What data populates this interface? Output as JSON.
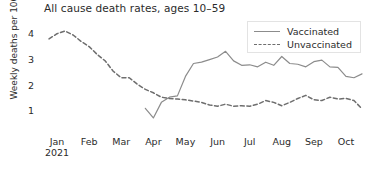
{
  "chart_data": {
    "type": "line",
    "title": "All cause death rates, ages 10–59",
    "xlabel": "",
    "ylabel": "Weekly deaths per 100k",
    "xlim": [
      0,
      40
    ],
    "ylim": [
      0.4,
      4.45
    ],
    "grid": false,
    "legend_position": "top-right",
    "y_ticks": [
      1,
      2,
      3,
      4
    ],
    "x_tick_labels": [
      "Jan",
      "Feb",
      "Mar",
      "Apr",
      "May",
      "Jun",
      "Jul",
      "Aug",
      "Sep",
      "Oct"
    ],
    "x_tick_sublabel": "2021",
    "x_tick_sublabel_index": 0,
    "series": [
      {
        "name": "Vaccinated",
        "style": "solid",
        "color": "#8c8c8c",
        "x": [
          13,
          14,
          15,
          16,
          17,
          18,
          19,
          20,
          21,
          22,
          23,
          24,
          25,
          26,
          27,
          28,
          29,
          30,
          31,
          32,
          33,
          34,
          35,
          36,
          37,
          38,
          39,
          40
        ],
        "values": [
          1.12,
          0.75,
          1.35,
          1.55,
          1.6,
          2.35,
          2.85,
          2.9,
          3.0,
          3.1,
          3.32,
          2.95,
          2.78,
          2.8,
          2.72,
          2.9,
          2.78,
          3.12,
          2.85,
          2.82,
          2.72,
          2.92,
          2.98,
          2.72,
          2.7,
          2.35,
          2.3,
          2.45
        ],
        "annotations": [
          {
            "label": "peak",
            "x": 23,
            "y": 3.32
          },
          {
            "label": "minimum",
            "x": 14,
            "y": 0.75
          }
        ]
      },
      {
        "name": "Unvaccinated",
        "style": "dashed",
        "color": "#6e6e6e",
        "x": [
          1,
          2,
          3,
          4,
          5,
          6,
          7,
          8,
          9,
          10,
          11,
          12,
          13,
          14,
          15,
          16,
          17,
          18,
          19,
          20,
          21,
          22,
          23,
          24,
          25,
          26,
          27,
          28,
          29,
          30,
          31,
          32,
          33,
          34,
          35,
          36,
          37,
          38,
          39,
          40
        ],
        "values": [
          3.8,
          4.0,
          4.1,
          3.95,
          3.7,
          3.5,
          3.2,
          2.95,
          2.55,
          2.3,
          2.3,
          2.05,
          1.85,
          1.72,
          1.55,
          1.5,
          1.48,
          1.45,
          1.4,
          1.35,
          1.25,
          1.2,
          1.28,
          1.2,
          1.22,
          1.2,
          1.28,
          1.42,
          1.35,
          1.22,
          1.35,
          1.5,
          1.62,
          1.45,
          1.42,
          1.55,
          1.48,
          1.5,
          1.42,
          1.1
        ],
        "annotations": [
          {
            "label": "peak",
            "x": 3,
            "y": 4.1
          }
        ]
      }
    ]
  },
  "legend": {
    "entries": [
      {
        "label": "Vaccinated",
        "style": "solid"
      },
      {
        "label": "Unvaccinated",
        "style": "dashed"
      }
    ]
  },
  "colors": {
    "vaccinated_line": "#8c8c8c",
    "unvaccinated_line": "#6e6e6e",
    "text": "#2b2b2b",
    "background": "#ffffff",
    "legend_border": "#e3e3e3"
  }
}
